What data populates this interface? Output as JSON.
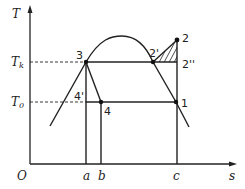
{
  "diagram": {
    "type": "T-s diagram (vapor compression refrigeration cycle)",
    "axes": {
      "y_label": "T",
      "x_label": "s",
      "origin_label": "O"
    },
    "temperature_levels": [
      {
        "label": "T",
        "sub": "k"
      },
      {
        "label": "T",
        "sub": "0"
      }
    ],
    "entropy_marks": [
      "a",
      "b",
      "c"
    ],
    "points": [
      "1",
      "2",
      "2'",
      "2''",
      "3",
      "4",
      "4'"
    ],
    "colors": {
      "line": "#222222",
      "background": "#ffffff"
    }
  }
}
